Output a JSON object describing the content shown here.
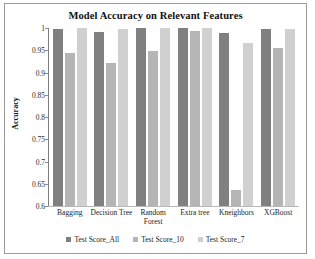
{
  "chart_data": {
    "type": "bar",
    "title": "Model Accuracy on Relevant Features",
    "xlabel": "",
    "ylabel": "Accuracy",
    "ylim": [
      0.6,
      1.0
    ],
    "yticks": [
      "0.6",
      "0.65",
      "0.7",
      "0.75",
      "0.8",
      "0.85",
      "0.9",
      "0.95",
      "1"
    ],
    "grid": false,
    "legend_position": "bottom",
    "categories": [
      "Bagging",
      "Decision Tree",
      "Random Forest",
      "Extra tree",
      "Kneighbors",
      "XGBoost"
    ],
    "series": [
      {
        "name": "Test Score_All",
        "color": "#808080",
        "values": [
          0.998,
          0.99,
          1.0,
          1.0,
          0.988,
          0.998
        ]
      },
      {
        "name": "Test Score_10",
        "color": "#b5b5b5",
        "values": [
          0.943,
          0.922,
          0.949,
          0.993,
          0.635,
          0.956
        ]
      },
      {
        "name": "Test Score_7",
        "color": "#d0d0d0",
        "values": [
          1.0,
          0.998,
          1.0,
          1.0,
          0.966,
          0.998
        ]
      }
    ]
  }
}
